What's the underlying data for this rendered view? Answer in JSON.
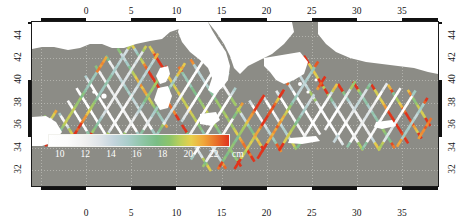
{
  "figure": {
    "kind": "altimetry-track-map",
    "region_name": "Mediterranean Sea",
    "land_color": "#ffffff",
    "sea_nodata_color": "#8c8c86",
    "frame_color": "#111111",
    "grid_color": "#cfcfc9"
  },
  "axes": {
    "x": {
      "label": "",
      "range": [
        -6,
        39
      ],
      "tick_interval": 5,
      "minor_interval": 1,
      "top_ticks": [
        "0",
        "5",
        "10",
        "15",
        "20",
        "25",
        "30",
        "35"
      ],
      "bottom_ticks": [
        "0",
        "5",
        "10",
        "15",
        "20",
        "25",
        "30",
        "35"
      ],
      "tick_values": [
        0,
        5,
        10,
        15,
        20,
        25,
        30,
        35
      ]
    },
    "y": {
      "label": "",
      "range": [
        30.6,
        45.2
      ],
      "tick_interval": 2,
      "minor_interval": 1,
      "left_ticks": [
        "44",
        "42",
        "40",
        "38",
        "36",
        "34",
        "32"
      ],
      "right_ticks": [
        "44",
        "42",
        "40",
        "38",
        "36",
        "34",
        "32"
      ],
      "tick_values": [
        44,
        42,
        40,
        38,
        36,
        34,
        32
      ]
    }
  },
  "colorbar": {
    "unit": "cm",
    "orientation": "horizontal",
    "range": [
      9,
      23
    ],
    "ticks": [
      "10",
      "12",
      "14",
      "16",
      "18",
      "20",
      "22"
    ],
    "tick_values": [
      10,
      12,
      14,
      16,
      18,
      20,
      22
    ],
    "tick_color": "#ffffff",
    "stops": [
      {
        "pos": 0,
        "color": "#ffffff"
      },
      {
        "pos": 0.2,
        "color": "#f0f0f0"
      },
      {
        "pos": 0.33,
        "color": "#ccdade"
      },
      {
        "pos": 0.46,
        "color": "#a5cbc6"
      },
      {
        "pos": 0.58,
        "color": "#7dbd8b"
      },
      {
        "pos": 0.7,
        "color": "#a9ca62"
      },
      {
        "pos": 0.8,
        "color": "#e8cf4d"
      },
      {
        "pos": 0.9,
        "color": "#ef8c33"
      },
      {
        "pos": 1,
        "color": "#e0341c"
      }
    ]
  },
  "chart_data": {
    "type": "heatmap",
    "title": "",
    "xlabel": "",
    "ylabel": "",
    "xlim": [
      -6,
      39
    ],
    "ylim": [
      30.6,
      45.2
    ],
    "grid": true,
    "legend_position": "inside-bottom-left",
    "colorbar_label": "cm",
    "colorbar_range": [
      9,
      23
    ],
    "value_classes": [
      {
        "name": "low",
        "range": [
          9,
          13
        ],
        "color": "#ffffff"
      },
      {
        "name": "low-mid",
        "range": [
          13,
          16
        ],
        "color": "#bdd4da"
      },
      {
        "name": "mid",
        "range": [
          16,
          19
        ],
        "color": "#7dbd8b"
      },
      {
        "name": "mid-high",
        "range": [
          19,
          21
        ],
        "color": "#e0c24d"
      },
      {
        "name": "high",
        "range": [
          21,
          23
        ],
        "color": "#e0341c"
      }
    ]
  }
}
